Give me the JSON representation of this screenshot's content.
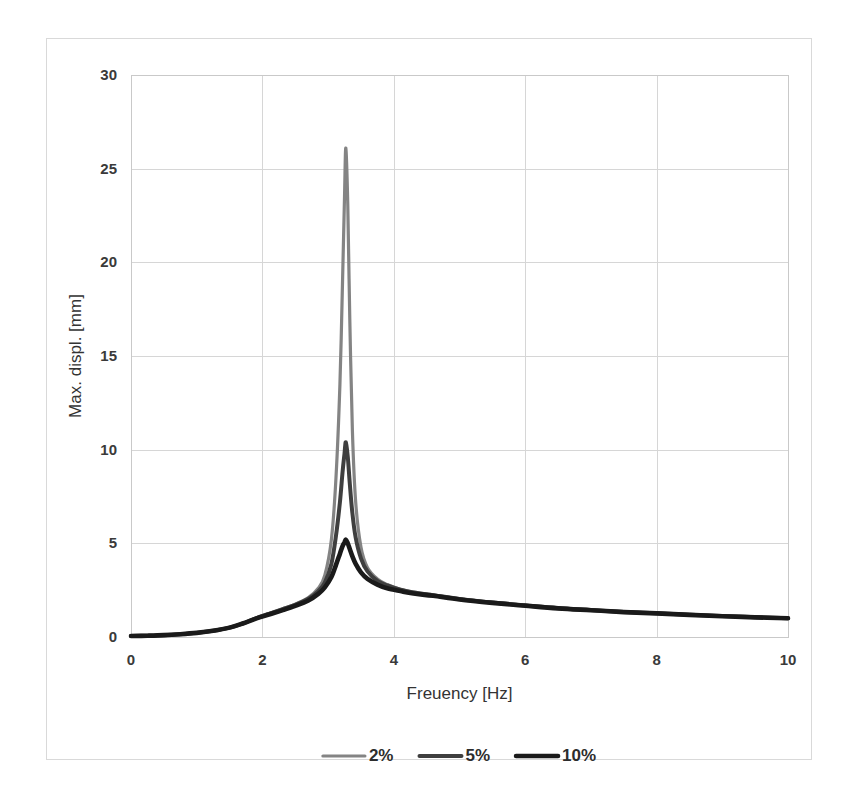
{
  "chart_data": {
    "type": "line",
    "title": "",
    "xlabel": "Freuency [Hz]",
    "ylabel": "Max. displ. [mm]",
    "xlim": [
      0,
      10
    ],
    "ylim": [
      0,
      30
    ],
    "xticks": [
      "0",
      "2",
      "4",
      "6",
      "8",
      "10"
    ],
    "xtick_values": [
      0,
      2,
      4,
      6,
      8,
      10
    ],
    "yticks": [
      "0",
      "5",
      "10",
      "15",
      "20",
      "25",
      "30"
    ],
    "ytick_values": [
      0,
      5,
      10,
      15,
      20,
      25,
      30
    ],
    "grid": true,
    "legend_position": "bottom",
    "legend": [
      "2%",
      "5%",
      "10%"
    ],
    "colors": {
      "series_2pct": "#848484",
      "series_5pct": "#3f3f3f",
      "series_10pct": "#1a1a1a",
      "gridline": "#d6d6d6",
      "plot_border": "#c9c9c9",
      "frame_border": "#d9d9d9",
      "background": "#ffffff"
    },
    "x": [
      0,
      0.25,
      0.5,
      0.75,
      1.0,
      1.25,
      1.5,
      1.7,
      1.9,
      2.1,
      2.3,
      2.5,
      2.7,
      2.85,
      2.95,
      3.05,
      3.12,
      3.18,
      3.22,
      3.25,
      3.27,
      3.3,
      3.33,
      3.37,
      3.42,
      3.5,
      3.6,
      3.75,
      3.9,
      4.1,
      4.3,
      4.6,
      5.0,
      5.5,
      6.0,
      6.5,
      7.0,
      7.5,
      8.0,
      8.5,
      9.0,
      9.5,
      10.0
    ],
    "series": [
      {
        "name": "2%",
        "color": "#848484",
        "values": [
          0.05,
          0.07,
          0.1,
          0.15,
          0.22,
          0.33,
          0.5,
          0.72,
          1.0,
          1.25,
          1.5,
          1.75,
          2.1,
          2.6,
          3.3,
          5.2,
          8.5,
          13.5,
          19.0,
          23.5,
          26.1,
          23.0,
          17.0,
          11.0,
          7.2,
          4.8,
          3.7,
          3.1,
          2.8,
          2.55,
          2.4,
          2.25,
          2.05,
          1.85,
          1.7,
          1.55,
          1.45,
          1.35,
          1.28,
          1.2,
          1.13,
          1.07,
          1.0
        ]
      },
      {
        "name": "5%",
        "color": "#3f3f3f",
        "values": [
          0.05,
          0.07,
          0.1,
          0.15,
          0.22,
          0.33,
          0.5,
          0.72,
          1.0,
          1.24,
          1.48,
          1.72,
          2.05,
          2.45,
          2.9,
          3.9,
          5.4,
          7.2,
          8.8,
          9.8,
          10.4,
          9.6,
          8.2,
          6.6,
          5.3,
          4.2,
          3.5,
          3.0,
          2.75,
          2.52,
          2.38,
          2.23,
          2.03,
          1.84,
          1.69,
          1.54,
          1.44,
          1.34,
          1.27,
          1.19,
          1.12,
          1.06,
          1.0
        ]
      },
      {
        "name": "10%",
        "color": "#1a1a1a",
        "values": [
          0.05,
          0.07,
          0.1,
          0.15,
          0.22,
          0.33,
          0.5,
          0.72,
          0.98,
          1.2,
          1.42,
          1.66,
          1.95,
          2.3,
          2.65,
          3.2,
          3.85,
          4.45,
          4.85,
          5.05,
          5.2,
          5.0,
          4.7,
          4.3,
          3.9,
          3.45,
          3.1,
          2.8,
          2.6,
          2.45,
          2.32,
          2.2,
          2.0,
          1.82,
          1.67,
          1.53,
          1.43,
          1.33,
          1.26,
          1.18,
          1.11,
          1.05,
          1.0
        ]
      }
    ]
  }
}
